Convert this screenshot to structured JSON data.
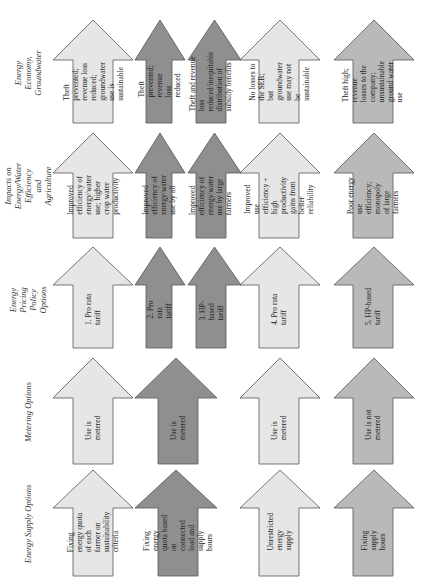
{
  "colors": {
    "light": "#e6e6e6",
    "dark": "#8f8f8f",
    "medium": "#b9b9b9",
    "stroke": "#555555"
  },
  "rows": [
    {
      "label": "Energy Economy, Groundwater"
    },
    {
      "label": "Impacts on Energy/Water Efficiency and Agriculture"
    },
    {
      "label": "Energy Pricing Policy Options"
    },
    {
      "label": "Metering Options"
    },
    {
      "label": "Energy Supply Options"
    }
  ],
  "columns": [
    {
      "shade": "light",
      "cells": [
        "Theft prevented; revenue loss reduced; groundwater use is sustainable",
        "Improved efficiency of energy/water use; higher crop water productivity",
        "1. Pro rata tariff",
        "Use is metered",
        "Fixing energy quota of each farmer on sustainability criteria"
      ]
    },
    {
      "shade": "dark",
      "cells": [
        "Theft prevented; revenue loss reduced",
        "Improved efficiency of energy/water use by all",
        "2. Pro rata tariff",
        "Use is metered",
        "Fixing energy quota based on connected load and supply hours"
      ]
    },
    {
      "shade": "dark",
      "cells": [
        "Theft and revenue loss reduced/inequitable distribution of subsidy benefits",
        "Improved efficiency of energy/water use by large farmers",
        "3. HP-based tariff"
      ]
    },
    {
      "shade": "light",
      "cells": [
        "No losses to the SEB; but groundwater use may not be sustainable",
        "Improved use efficiency + high productivity gains from better reliability",
        "4. Pro rata tariff",
        "Use is metered",
        "Unrestricted energy supply"
      ]
    },
    {
      "shade": "medium",
      "cells": [
        "Theft high; revenue losses to the company; unsustainable ground water use",
        "Poor energy use efficiency; monopoly of large farmers",
        "5. HP-based tariff",
        "Use is not metered",
        "Fixing supply hours"
      ]
    }
  ]
}
